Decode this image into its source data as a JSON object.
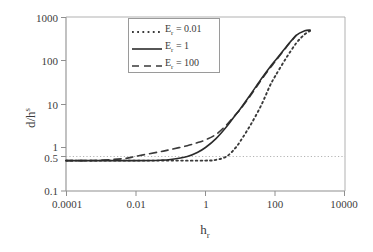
{
  "chart_data": {
    "type": "line",
    "title": "",
    "xlabel": "h_r",
    "xlabel_base": "h",
    "xlabel_sub": "r",
    "ylabel": "d/h^s",
    "ylabel_base": "d/h",
    "ylabel_sup": "s",
    "xscale": "log",
    "yscale": "log",
    "xlim": [
      0.0001,
      10000
    ],
    "ylim": [
      0.1,
      1000
    ],
    "xticks": [
      "0.0001",
      "0.01",
      "1",
      "100",
      "10000"
    ],
    "xtick_values": [
      0.0001,
      0.01,
      1,
      100,
      10000
    ],
    "yticks": [
      "1000",
      "100",
      "10",
      "1",
      "0.5",
      "0.1"
    ],
    "ytick_values": [
      1000,
      100,
      10,
      1,
      0.5,
      0.1
    ],
    "grid": false,
    "reference_line": {
      "value": 0.5,
      "orientation": "horizontal",
      "style": "dotted"
    },
    "legend_position": "top-center",
    "series": [
      {
        "name": "Er = 0.01",
        "label_base": "E",
        "label_sub": "r",
        "label_rest": " = 0.01",
        "style": "dotted",
        "color": "#3a3a3a",
        "x": [
          0.0001,
          0.001,
          0.01,
          0.1,
          1,
          2,
          4,
          7,
          10,
          20,
          40,
          70,
          100,
          200,
          400,
          700,
          1000
        ],
        "y": [
          0.5,
          0.5,
          0.5,
          0.5,
          0.5,
          0.52,
          0.62,
          0.95,
          1.4,
          3.4,
          9.5,
          26,
          44,
          110,
          250,
          400,
          480
        ]
      },
      {
        "name": "Er = 1",
        "label_base": "E",
        "label_sub": "r",
        "label_rest": " = 1",
        "style": "solid",
        "color": "#2b2b2b",
        "x": [
          0.0001,
          0.001,
          0.01,
          0.05,
          0.1,
          0.3,
          0.6,
          1,
          2,
          4,
          7,
          10,
          20,
          40,
          70,
          100,
          200,
          400,
          700,
          1000
        ],
        "y": [
          0.5,
          0.5,
          0.5,
          0.51,
          0.53,
          0.62,
          0.78,
          1.0,
          1.6,
          3.0,
          5.4,
          7.8,
          17,
          38,
          70,
          100,
          200,
          380,
          480,
          500
        ]
      },
      {
        "name": "Er = 100",
        "label_base": "E",
        "label_sub": "r",
        "label_rest": " = 100",
        "style": "dashed",
        "color": "#3a3a3a",
        "x": [
          0.0001,
          0.0005,
          0.001,
          0.005,
          0.01,
          0.05,
          0.1,
          0.3,
          0.6,
          1,
          2,
          4,
          7,
          10,
          20,
          40,
          70,
          100,
          200,
          400
        ],
        "y": [
          0.5,
          0.5,
          0.51,
          0.56,
          0.63,
          0.8,
          0.9,
          1.1,
          1.3,
          1.5,
          2.0,
          3.3,
          5.5,
          7.6,
          16,
          36,
          66,
          95,
          195,
          380
        ]
      }
    ]
  },
  "axes": {
    "frame_color": "#8f8f8f",
    "tick_color": "#8f8f8f",
    "reference_color": "#b0b0b0"
  }
}
